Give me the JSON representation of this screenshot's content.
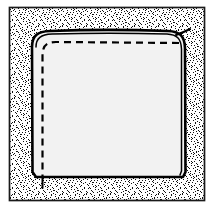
{
  "figure": {
    "title": "Stippled-ground line drawing of a rounded square panel with dashed seam line",
    "type": "line-art-illustration",
    "caption": "",
    "canvas": {
      "width": 213,
      "height": 214,
      "background_color": "#ffffff"
    },
    "frame": {
      "name": "outer-frame",
      "x": 9,
      "y": 7,
      "width": 196,
      "height": 194,
      "stroke_color": "#1a1a1a",
      "stroke_width": 1.6,
      "fill_color": "none"
    },
    "stipple_ground": {
      "name": "stipple-background",
      "description": "random black dot texture filling the frame around the panel",
      "base_color": "#ffffff",
      "dot_color": "#111111",
      "density_percent": 38,
      "dot_size": 1
    },
    "panel": {
      "name": "rounded-square-panel",
      "description": "main rounded square panel with light fill",
      "fill_color": "#f2f2f2",
      "stroke_color": "#000000",
      "stroke_width": 2.4,
      "corner_radius_top_left": 16,
      "corner_radius_top_right": 18,
      "corner_radius_bottom_left": 5,
      "corner_radius_bottom_right": 5,
      "bounds": {
        "x": 32,
        "y": 31,
        "width": 152,
        "height": 146
      }
    },
    "inner_edge_line": {
      "name": "panel-inner-contour",
      "description": "second thin solid contour just inside the right and top edges",
      "stroke_color": "#000000",
      "stroke_width": 1.4
    },
    "dashed_seam": {
      "name": "dashed-seam-line",
      "description": "dashed stitching line inset from the top and left edges, ending in a tail below the bottom edge",
      "stroke_color": "#000000",
      "stroke_width": 2.2,
      "dash_length": 7,
      "gap_length": 5,
      "inset_top": 11,
      "inset_left": 11
    },
    "corner_tail": {
      "name": "top-right-corner-tail",
      "description": "short hooked line flicking out past the upper-right corner",
      "stroke_color": "#000000",
      "stroke_width": 2.0
    },
    "bottom_tail": {
      "name": "bottom-left-seam-tail",
      "description": "dashed seam continues below the panel bottom edge as a short tail",
      "stroke_color": "#000000",
      "stroke_width": 2.0
    },
    "palette": {
      "ink": "#000000",
      "frame": "#1a1a1a",
      "panel_fill": "#f2f2f2",
      "paper": "#ffffff"
    }
  }
}
